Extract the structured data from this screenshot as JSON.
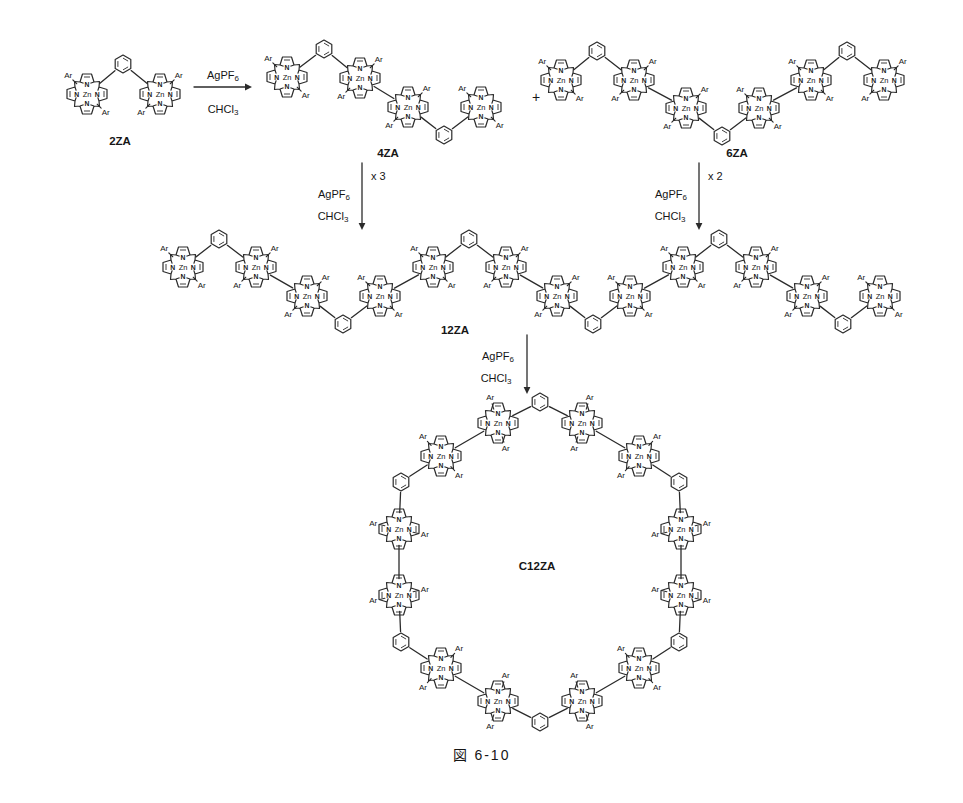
{
  "scheme": {
    "caption": {
      "text": "図 6-10"
    },
    "colors": {
      "line": "#2b2b2b",
      "metal_text": "#8c8c8c",
      "text": "#161616"
    },
    "atoms": {
      "metal": "Zn",
      "nitrogen": "N",
      "aryl": "Ar"
    },
    "reagent": {
      "base": "AgPF",
      "sub": "6"
    },
    "solvent": {
      "base": "CHCl",
      "sub": "3"
    },
    "plus": {
      "text": "+",
      "x": 536,
      "y": 97
    },
    "compounds": [
      {
        "label": "2ZA",
        "lx": 120,
        "ly": 141,
        "units": [
          {
            "x": 87,
            "y": 94,
            "ar": [
              135,
              315
            ]
          },
          {
            "x": 160,
            "y": 94,
            "ar": [
              45,
              225
            ]
          }
        ],
        "links": [
          {
            "t": "p",
            "a": 0,
            "b": 1,
            "x": 123,
            "y": 64
          }
        ]
      },
      {
        "label": "4ZA",
        "lx": 388,
        "ly": 153,
        "units": [
          {
            "x": 287,
            "y": 77,
            "ar": [
              135,
              315
            ]
          },
          {
            "x": 360,
            "y": 78,
            "ar": [
              45,
              225
            ]
          },
          {
            "x": 408,
            "y": 107,
            "ar": [
              45,
              225
            ]
          },
          {
            "x": 481,
            "y": 107,
            "ar": [
              135,
              315
            ]
          }
        ],
        "links": [
          {
            "t": "p",
            "a": 0,
            "b": 1,
            "x": 324,
            "y": 49
          },
          {
            "t": "b",
            "a": 1,
            "b": 2
          },
          {
            "t": "p",
            "a": 2,
            "b": 3,
            "x": 444,
            "y": 135
          }
        ]
      },
      {
        "label": "6ZA",
        "lx": 737,
        "ly": 153,
        "units": [
          {
            "x": 561,
            "y": 80,
            "ar": [
              135,
              315
            ]
          },
          {
            "x": 634,
            "y": 80,
            "ar": [
              45,
              225
            ]
          },
          {
            "x": 686,
            "y": 108,
            "ar": [
              45,
              225
            ]
          },
          {
            "x": 759,
            "y": 108,
            "ar": [
              135,
              315
            ]
          },
          {
            "x": 811,
            "y": 80,
            "ar": [
              135,
              315
            ]
          },
          {
            "x": 884,
            "y": 80,
            "ar": [
              45,
              225
            ]
          }
        ],
        "links": [
          {
            "t": "p",
            "a": 0,
            "b": 1,
            "x": 597,
            "y": 51
          },
          {
            "t": "b",
            "a": 1,
            "b": 2
          },
          {
            "t": "p",
            "a": 2,
            "b": 3,
            "x": 722,
            "y": 136
          },
          {
            "t": "b",
            "a": 3,
            "b": 4
          },
          {
            "t": "p",
            "a": 4,
            "b": 5,
            "x": 847,
            "y": 51
          }
        ]
      },
      {
        "label": "12ZA",
        "lx": 455,
        "ly": 330,
        "units": [
          {
            "x": 183,
            "y": 267,
            "ar": [
              135,
              315
            ]
          },
          {
            "x": 256,
            "y": 267,
            "ar": [
              45,
              225
            ]
          },
          {
            "x": 307,
            "y": 296,
            "ar": [
              45,
              225
            ]
          },
          {
            "x": 380,
            "y": 296,
            "ar": [
              135,
              315
            ]
          },
          {
            "x": 433,
            "y": 267,
            "ar": [
              135,
              315
            ]
          },
          {
            "x": 506,
            "y": 267,
            "ar": [
              45,
              225
            ]
          },
          {
            "x": 557,
            "y": 296,
            "ar": [
              45,
              225
            ]
          },
          {
            "x": 630,
            "y": 296,
            "ar": [
              135,
              315
            ]
          },
          {
            "x": 683,
            "y": 267,
            "ar": [
              135,
              315
            ]
          },
          {
            "x": 756,
            "y": 267,
            "ar": [
              45,
              225
            ]
          },
          {
            "x": 807,
            "y": 296,
            "ar": [
              45,
              225
            ]
          },
          {
            "x": 880,
            "y": 296,
            "ar": [
              135,
              315
            ]
          }
        ],
        "links": [
          {
            "t": "p",
            "a": 0,
            "b": 1,
            "x": 219,
            "y": 239
          },
          {
            "t": "b",
            "a": 1,
            "b": 2
          },
          {
            "t": "p",
            "a": 2,
            "b": 3,
            "x": 343,
            "y": 324
          },
          {
            "t": "b",
            "a": 3,
            "b": 4
          },
          {
            "t": "p",
            "a": 4,
            "b": 5,
            "x": 469,
            "y": 239
          },
          {
            "t": "b",
            "a": 5,
            "b": 6
          },
          {
            "t": "p",
            "a": 6,
            "b": 7,
            "x": 593,
            "y": 324
          },
          {
            "t": "b",
            "a": 7,
            "b": 8
          },
          {
            "t": "p",
            "a": 8,
            "b": 9,
            "x": 719,
            "y": 239
          },
          {
            "t": "b",
            "a": 9,
            "b": 10
          },
          {
            "t": "p",
            "a": 10,
            "b": 11,
            "x": 843,
            "y": 324
          }
        ]
      },
      {
        "label": "C12ZA",
        "lx": 537,
        "ly": 566,
        "units": [
          {
            "x": 681,
            "y": 529,
            "ar": [
              13,
              193
            ]
          },
          {
            "x": 639,
            "y": 456,
            "ar": [
              47,
              227
            ]
          },
          {
            "x": 582,
            "y": 423,
            "ar": [
              73,
              253
            ]
          },
          {
            "x": 498,
            "y": 423,
            "ar": [
              107,
              287
            ]
          },
          {
            "x": 441,
            "y": 456,
            "ar": [
              133,
              313
            ]
          },
          {
            "x": 399,
            "y": 529,
            "ar": [
              167,
              347
            ]
          },
          {
            "x": 399,
            "y": 595,
            "ar": [
              193,
              13
            ]
          },
          {
            "x": 441,
            "y": 668,
            "ar": [
              227,
              47
            ]
          },
          {
            "x": 498,
            "y": 701,
            "ar": [
              253,
              73
            ]
          },
          {
            "x": 582,
            "y": 701,
            "ar": [
              287,
              107
            ]
          },
          {
            "x": 639,
            "y": 668,
            "ar": [
              313,
              133
            ]
          },
          {
            "x": 681,
            "y": 595,
            "ar": [
              347,
              167
            ]
          }
        ],
        "links": [
          {
            "t": "p",
            "a": 2,
            "b": 3,
            "x": 540,
            "y": 402
          },
          {
            "t": "p",
            "a": 0,
            "b": 1,
            "x": 679,
            "y": 482
          },
          {
            "t": "p",
            "a": 4,
            "b": 5,
            "x": 401,
            "y": 482
          },
          {
            "t": "p",
            "a": 6,
            "b": 7,
            "x": 401,
            "y": 642
          },
          {
            "t": "p",
            "a": 8,
            "b": 9,
            "x": 540,
            "y": 722
          },
          {
            "t": "p",
            "a": 10,
            "b": 11,
            "x": 679,
            "y": 642
          },
          {
            "t": "b",
            "a": 1,
            "b": 2
          },
          {
            "t": "b",
            "a": 3,
            "b": 4
          },
          {
            "t": "b",
            "a": 5,
            "b": 6
          },
          {
            "t": "b",
            "a": 7,
            "b": 8
          },
          {
            "t": "b",
            "a": 9,
            "b": 10
          },
          {
            "t": "b",
            "a": 11,
            "b": 0
          }
        ]
      }
    ],
    "arrows": [
      {
        "dir": "right",
        "x1": 194,
        "y1": 87,
        "x2": 252,
        "y2": 87,
        "rx": 223,
        "ry": 75,
        "sx": 223,
        "sy": 109
      },
      {
        "dir": "down",
        "x1": 362,
        "y1": 163,
        "x2": 362,
        "y2": 230,
        "mult": "x 3",
        "mx": 371,
        "my": 176,
        "rx": 334,
        "ry": 194,
        "sx": 333,
        "sy": 216
      },
      {
        "dir": "down",
        "x1": 699,
        "y1": 163,
        "x2": 699,
        "y2": 230,
        "mult": "x 2",
        "mx": 708,
        "my": 176,
        "rx": 671,
        "ry": 194,
        "sx": 670,
        "sy": 216
      },
      {
        "dir": "down",
        "x1": 527,
        "y1": 335,
        "x2": 527,
        "y2": 394,
        "rx": 498,
        "ry": 356,
        "sx": 496,
        "sy": 378
      }
    ]
  }
}
